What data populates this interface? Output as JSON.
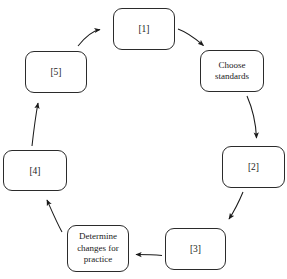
{
  "diagram": {
    "type": "cycle-diagram",
    "title": "",
    "background_color": "#ffffff",
    "box_border_color": "#2b2b2b",
    "box_fill_color": "#ffffff",
    "text_color": "#1a1a1a",
    "arrow_color": "#1a1a1a",
    "direction": "clockwise",
    "node_count": 7,
    "nodes": [
      {
        "id": "node-1",
        "label": "[1]",
        "position": "top",
        "x": 113,
        "y": 8,
        "width": 62,
        "height": 42
      },
      {
        "id": "node-choose-standards",
        "label": "Choose\nstandards",
        "position": "upper-right",
        "x": 200,
        "y": 50,
        "width": 64,
        "height": 42
      },
      {
        "id": "node-2",
        "label": "[2]",
        "position": "right",
        "x": 222,
        "y": 146,
        "width": 63,
        "height": 42
      },
      {
        "id": "node-3",
        "label": "[3]",
        "position": "lower-right",
        "x": 165,
        "y": 228,
        "width": 61,
        "height": 42
      },
      {
        "id": "node-determine-changes",
        "label": "Determine\nchanges for\npractice",
        "position": "lower-left",
        "x": 67,
        "y": 225,
        "width": 62,
        "height": 47
      },
      {
        "id": "node-4",
        "label": "[4]",
        "position": "left",
        "x": 3,
        "y": 150,
        "width": 64,
        "height": 41
      },
      {
        "id": "node-5",
        "label": "[5]",
        "position": "upper-left",
        "x": 25,
        "y": 51,
        "width": 62,
        "height": 42
      }
    ],
    "arrows": [
      {
        "id": "arrow-5-to-1",
        "from": "node-5",
        "to": "node-1"
      },
      {
        "id": "arrow-1-to-choose-standards",
        "from": "node-1",
        "to": "node-choose-standards"
      },
      {
        "id": "arrow-choose-standards-to-2",
        "from": "node-choose-standards",
        "to": "node-2"
      },
      {
        "id": "arrow-2-to-3",
        "from": "node-2",
        "to": "node-3"
      },
      {
        "id": "arrow-3-to-determine-changes",
        "from": "node-3",
        "to": "node-determine-changes"
      },
      {
        "id": "arrow-determine-changes-to-4",
        "from": "node-determine-changes",
        "to": "node-4"
      },
      {
        "id": "arrow-4-to-5",
        "from": "node-4",
        "to": "node-5"
      }
    ]
  }
}
